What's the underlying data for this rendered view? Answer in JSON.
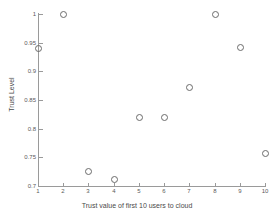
{
  "chart_data": {
    "type": "scatter",
    "title": "",
    "xlabel": "Trust value of first 10 users to cloud",
    "ylabel": "Trust Level",
    "xlim": [
      1,
      10
    ],
    "ylim": [
      0.7,
      1
    ],
    "grid": false,
    "legend": null,
    "marker": "open-circle",
    "x": [
      1,
      2,
      3,
      4,
      5,
      6,
      7,
      8,
      9,
      10
    ],
    "values": [
      0.941,
      1.0,
      0.727,
      0.712,
      0.821,
      0.821,
      0.872,
      1.0,
      0.943,
      0.757
    ],
    "xticks": [
      "1",
      "2",
      "3",
      "4",
      "5",
      "6",
      "7",
      "8",
      "9",
      "10"
    ],
    "yticks": [
      "0.7",
      "0.75",
      "0.8",
      "0.85",
      "0.9",
      "0.95",
      "1"
    ],
    "ytick_values": [
      0.7,
      0.75,
      0.8,
      0.85,
      0.9,
      0.95,
      1.0
    ],
    "points": [
      {
        "x": 1,
        "y": 0.941
      },
      {
        "x": 2,
        "y": 1.0
      },
      {
        "x": 3,
        "y": 0.727
      },
      {
        "x": 4,
        "y": 0.712
      },
      {
        "x": 5,
        "y": 0.821
      },
      {
        "x": 6,
        "y": 0.821
      },
      {
        "x": 7,
        "y": 0.872
      },
      {
        "x": 8,
        "y": 1.0
      },
      {
        "x": 9,
        "y": 0.943
      },
      {
        "x": 10,
        "y": 0.757
      }
    ],
    "colors": {
      "marker_edge": "#6b6b6b",
      "axis": "#9a9a9a",
      "text": "#4a4a4a",
      "background": "#ffffff"
    }
  }
}
